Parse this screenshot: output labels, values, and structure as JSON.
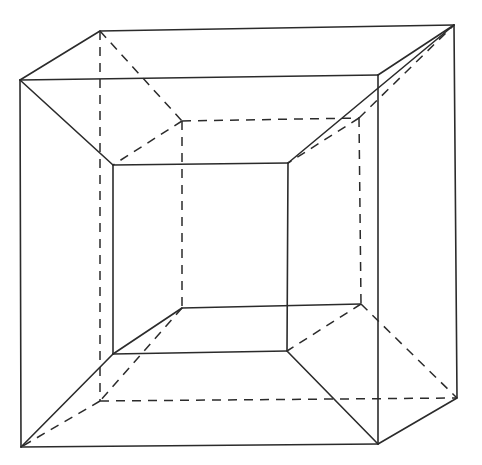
{
  "diagram": {
    "type": "geometry-wireframe",
    "stroke_color": "#2b2b2b",
    "background": "#ffffff",
    "vertices": {
      "O_ftl": [
        20,
        80
      ],
      "O_ftr": [
        378,
        75
      ],
      "O_fbl": [
        21,
        447
      ],
      "O_fbr": [
        378,
        444
      ],
      "O_btl": [
        100,
        31
      ],
      "O_btr": [
        454,
        25
      ],
      "O_bbl": [
        100,
        401
      ],
      "O_bbr": [
        457,
        398
      ],
      "I_ftl": [
        113,
        165
      ],
      "I_ftr": [
        288,
        163
      ],
      "I_fbl": [
        113,
        354
      ],
      "I_fbr": [
        287,
        351
      ],
      "I_btl": [
        182,
        121
      ],
      "I_btr": [
        359,
        118
      ],
      "I_bbl": [
        182,
        308
      ],
      "I_bbr": [
        361,
        304
      ]
    },
    "solid_edges": [
      [
        "O_ftl",
        "O_ftr"
      ],
      [
        "O_ftr",
        "O_fbr"
      ],
      [
        "O_fbr",
        "O_fbl"
      ],
      [
        "O_fbl",
        "O_ftl"
      ],
      [
        "O_ftl",
        "O_btl"
      ],
      [
        "O_btl",
        "O_btr"
      ],
      [
        "O_btr",
        "O_ftr"
      ],
      [
        "O_btr",
        "O_bbr"
      ],
      [
        "O_bbr",
        "O_fbr"
      ],
      [
        "I_ftl",
        "I_ftr"
      ],
      [
        "I_ftr",
        "I_fbr"
      ],
      [
        "I_fbr",
        "I_fbl"
      ],
      [
        "I_fbl",
        "I_ftl"
      ],
      [
        "O_ftl",
        "I_ftl"
      ],
      [
        "O_btr",
        "I_ftr"
      ],
      [
        "O_fbl",
        "I_fbl"
      ],
      [
        "O_fbr",
        "I_fbr"
      ],
      [
        "I_fbl",
        "I_bbl"
      ],
      [
        "I_bbl",
        "I_bbr"
      ]
    ],
    "dashed_edges": [
      [
        "O_btl",
        "O_bbl"
      ],
      [
        "O_bbl",
        "O_bbr"
      ],
      [
        "O_bbl",
        "O_fbl"
      ],
      [
        "O_btl",
        "I_btl"
      ],
      [
        "I_btl",
        "I_btr"
      ],
      [
        "I_btl",
        "I_bbl"
      ],
      [
        "I_btr",
        "I_bbr"
      ],
      [
        "I_btr",
        "O_btr"
      ],
      [
        "I_bbr",
        "O_bbr"
      ],
      [
        "I_btl",
        "I_ftl"
      ],
      [
        "I_btr",
        "I_ftr"
      ],
      [
        "I_bbr",
        "I_fbr"
      ],
      [
        "I_bbl",
        "O_bbl"
      ]
    ]
  }
}
